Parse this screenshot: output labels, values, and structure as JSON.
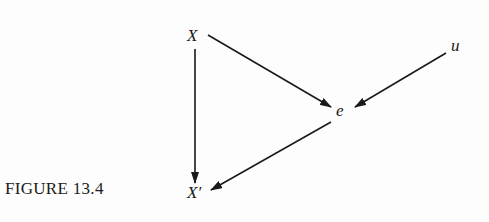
{
  "caption": "FIGURE 13.4",
  "nodes": {
    "X": "X",
    "u": "u",
    "e": "e",
    "Xprime": "X′"
  },
  "edges": [
    {
      "from": "X",
      "to": "e"
    },
    {
      "from": "u",
      "to": "e"
    },
    {
      "from": "X",
      "to": "X′"
    },
    {
      "from": "e",
      "to": "X′"
    }
  ],
  "colors": {
    "ink": "#1a1a1a",
    "background": "#fdfdfd"
  }
}
